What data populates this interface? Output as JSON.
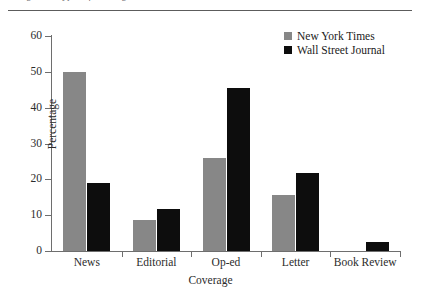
{
  "caption": {
    "text": "Figure 1. Types of coverage"
  },
  "chart_data": {
    "type": "bar",
    "title": "",
    "xlabel": "Coverage",
    "ylabel": "Percentage",
    "categories": [
      "News",
      "Editorial",
      "Op-ed",
      "Letter",
      "Book Review"
    ],
    "series": [
      {
        "name": "New York Times",
        "color": "#878787",
        "values": [
          50,
          8.7,
          26,
          15.6,
          0
        ]
      },
      {
        "name": "Wall Street Journal",
        "color": "#0d0d0d",
        "values": [
          19,
          11.7,
          45.5,
          21.8,
          2.5
        ]
      }
    ],
    "ylim": [
      0,
      60
    ],
    "yticks": [
      0,
      10,
      20,
      30,
      40,
      50,
      60
    ],
    "ytick_labels": [
      "0",
      "10",
      "20",
      "30",
      "40",
      "50",
      "60"
    ],
    "grid": false,
    "legend_position": "top-right"
  }
}
